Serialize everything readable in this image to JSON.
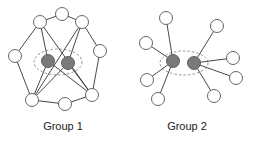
{
  "groups": [
    {
      "label": "Group 1",
      "label_pos": {
        "x": 23,
        "y": 120
      },
      "ellipse": {
        "cx": 58,
        "cy": 62,
        "rx": 24,
        "ry": 13
      },
      "nodes": [
        {
          "id": "top",
          "x": 62,
          "y": 14,
          "type": "white"
        },
        {
          "id": "upper-left",
          "x": 40,
          "y": 22,
          "type": "white"
        },
        {
          "id": "upper-right",
          "x": 82,
          "y": 22,
          "type": "white"
        },
        {
          "id": "left",
          "x": 15,
          "y": 56,
          "type": "white"
        },
        {
          "id": "right",
          "x": 100,
          "y": 51,
          "type": "white"
        },
        {
          "id": "gray-left",
          "x": 48,
          "y": 61,
          "type": "gray"
        },
        {
          "id": "gray-right",
          "x": 68,
          "y": 63,
          "type": "gray"
        },
        {
          "id": "bottom-left",
          "x": 32,
          "y": 100,
          "type": "white"
        },
        {
          "id": "bottom-middle",
          "x": 65,
          "y": 104,
          "type": "white"
        },
        {
          "id": "bottom-right",
          "x": 92,
          "y": 95,
          "type": "white"
        }
      ],
      "edges": [
        [
          "top",
          "upper-left"
        ],
        [
          "top",
          "upper-right"
        ],
        [
          "upper-left",
          "left"
        ],
        [
          "upper-right",
          "right"
        ],
        [
          "left",
          "bottom-left"
        ],
        [
          "right",
          "bottom-right"
        ],
        [
          "bottom-left",
          "bottom-middle"
        ],
        [
          "bottom-middle",
          "bottom-right"
        ],
        [
          "upper-left",
          "gray-left"
        ],
        [
          "upper-left",
          "bottom-right"
        ],
        [
          "upper-right",
          "gray-right"
        ],
        [
          "upper-right",
          "bottom-left"
        ],
        [
          "gray-left",
          "bottom-left"
        ],
        [
          "gray-left",
          "bottom-right"
        ],
        [
          "gray-right",
          "bottom-left"
        ],
        [
          "gray-right",
          "bottom-right"
        ]
      ]
    },
    {
      "label": "Group 2",
      "label_pos": {
        "x": 147,
        "y": 120
      },
      "ellipse": {
        "cx": 184,
        "cy": 63,
        "rx": 24,
        "ry": 12
      },
      "nodes": [
        {
          "id": "gray-left",
          "x": 173,
          "y": 61,
          "type": "gray"
        },
        {
          "id": "gray-right",
          "x": 194,
          "y": 63,
          "type": "gray"
        },
        {
          "id": "l1",
          "x": 166,
          "y": 18,
          "type": "white"
        },
        {
          "id": "l2",
          "x": 146,
          "y": 43,
          "type": "white"
        },
        {
          "id": "l3",
          "x": 147,
          "y": 80,
          "type": "white"
        },
        {
          "id": "l4",
          "x": 158,
          "y": 99,
          "type": "white"
        },
        {
          "id": "r1",
          "x": 217,
          "y": 26,
          "type": "white"
        },
        {
          "id": "r2",
          "x": 233,
          "y": 58,
          "type": "white"
        },
        {
          "id": "r3",
          "x": 236,
          "y": 78,
          "type": "white"
        },
        {
          "id": "r4",
          "x": 214,
          "y": 96,
          "type": "white"
        }
      ],
      "edges": [
        [
          "gray-left",
          "l1"
        ],
        [
          "gray-left",
          "l2"
        ],
        [
          "gray-left",
          "l3"
        ],
        [
          "gray-left",
          "l4"
        ],
        [
          "gray-right",
          "r1"
        ],
        [
          "gray-right",
          "r2"
        ],
        [
          "gray-right",
          "r3"
        ],
        [
          "gray-right",
          "r4"
        ]
      ]
    }
  ],
  "node_radius": 6.5,
  "colors": {
    "gray_node": "#7a7a7a",
    "white_node": "#ffffff",
    "edge": "#333333"
  }
}
